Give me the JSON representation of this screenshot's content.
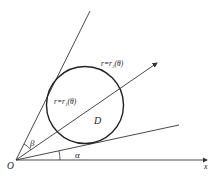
{
  "diagram": {
    "labels": {
      "origin": "O",
      "x_axis": "x",
      "alpha": "α",
      "beta": "β",
      "region": "D",
      "outer_curve": "r=r₂(θ)",
      "inner_curve": "r=r₁(θ)"
    },
    "colors": {
      "line": "#333333",
      "circle": "#222222",
      "background": "#ffffff"
    }
  }
}
